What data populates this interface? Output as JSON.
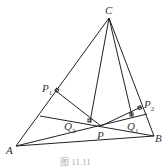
{
  "diagram": {
    "points": {
      "A": {
        "x": 16,
        "y": 146,
        "label": "A"
      },
      "B": {
        "x": 154,
        "y": 136,
        "label": "B"
      },
      "C": {
        "x": 109,
        "y": 18,
        "label": "C"
      },
      "P": {
        "x": 101,
        "y": 126,
        "label": "P"
      },
      "P1": {
        "x": 56,
        "y": 91,
        "label": "P",
        "sub": "1"
      },
      "P2": {
        "x": 141,
        "y": 107,
        "label": "P",
        "sub": "2"
      },
      "Q1": {
        "x": 132,
        "y": 116,
        "label": "Q",
        "sub": "1"
      },
      "Q2": {
        "x": 90,
        "y": 122,
        "label": "Q",
        "sub": "2"
      }
    },
    "caption": "图 11.11"
  }
}
